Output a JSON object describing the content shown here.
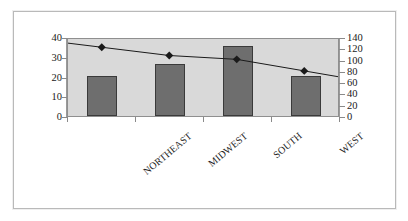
{
  "chart_data": {
    "type": "bar",
    "title": "",
    "subtitle": "",
    "xlabel": "",
    "categories": [
      "NORTHEAST",
      "MIDWEST",
      "SOUTH",
      "WEST"
    ],
    "series": [
      {
        "name": "bars",
        "type": "bar",
        "axis": "left",
        "color": "#6e6e6e",
        "values": [
          20.5,
          26.5,
          35.5,
          20.5
        ]
      },
      {
        "name": "line",
        "type": "line",
        "axis": "right",
        "color": "#1a1a1a",
        "marker": "diamond",
        "values": [
          125,
          110,
          103,
          82
        ]
      }
    ],
    "left_axis": {
      "label": "",
      "ylim": [
        0,
        40
      ],
      "ticks": [
        0,
        10,
        20,
        30,
        40
      ],
      "tick_labels": [
        "0",
        "10",
        "20",
        "30",
        "40"
      ]
    },
    "right_axis": {
      "label": "",
      "ylim": [
        0,
        140
      ],
      "ticks": [
        0,
        20,
        40,
        60,
        80,
        100,
        120,
        140
      ],
      "tick_labels": [
        "0",
        "20",
        "40",
        "60",
        "80",
        "100",
        "120",
        "140"
      ]
    },
    "legend": null,
    "legend_position": "none",
    "grid": false,
    "plot_background": "#d9d9d9",
    "figure_background": "#ffffff"
  }
}
